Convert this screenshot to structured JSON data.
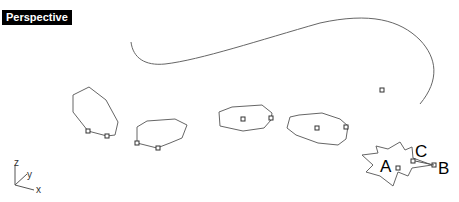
{
  "viewport": {
    "title": "Perspective"
  },
  "axes": {
    "z": "z",
    "y": "y",
    "x": "x"
  },
  "labels": {
    "a": "A",
    "b": "B",
    "c": "C"
  },
  "colors": {
    "curve": "#555555",
    "label_bg": "#000000",
    "label_fg": "#ffffff"
  }
}
